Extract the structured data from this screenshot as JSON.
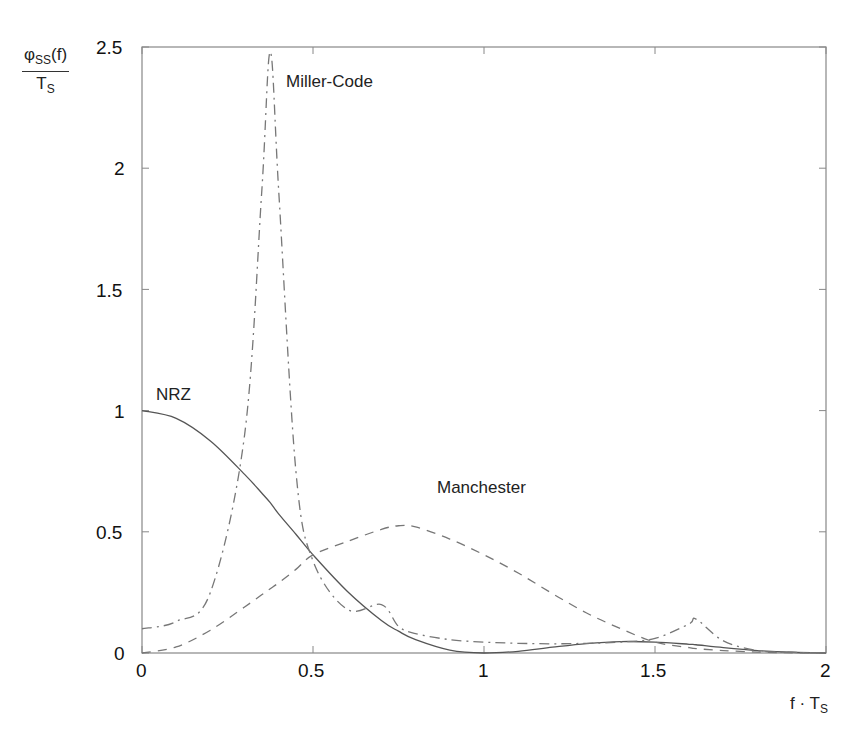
{
  "chart_data": {
    "type": "line",
    "title": "",
    "xlabel": "f·T_S",
    "ylabel": "φ_SS(f) / T_S",
    "xlim": [
      0,
      2
    ],
    "ylim": [
      0,
      2.5
    ],
    "xticks": [
      0,
      0.5,
      1,
      1.5,
      2
    ],
    "yticks": [
      0,
      0.5,
      1,
      1.5,
      2,
      2.5
    ],
    "xtick_labels": [
      "0",
      "0.5",
      "1",
      "1.5",
      "2"
    ],
    "ytick_labels": [
      "0",
      "0.5",
      "1",
      "1.5",
      "2",
      "2.5"
    ],
    "grid": false,
    "legend": "none (inline annotations)",
    "x": [
      0,
      0.1,
      0.2,
      0.3,
      0.35,
      0.375,
      0.4,
      0.45,
      0.5,
      0.6,
      0.7,
      0.75,
      0.8,
      0.9,
      1.0,
      1.1,
      1.2,
      1.3,
      1.4,
      1.5,
      1.6,
      1.62,
      1.7,
      1.8,
      1.9,
      2.0
    ],
    "series": [
      {
        "name": "NRZ",
        "style": "solid",
        "values": [
          1.0,
          0.968,
          0.875,
          0.737,
          0.66,
          0.62,
          0.573,
          0.49,
          0.405,
          0.255,
          0.134,
          0.09,
          0.055,
          0.012,
          0.0,
          0.007,
          0.024,
          0.039,
          0.047,
          0.045,
          0.036,
          0.034,
          0.022,
          0.01,
          0.003,
          0.0
        ]
      },
      {
        "name": "Manchester",
        "style": "dashed",
        "values": [
          0.0,
          0.025,
          0.094,
          0.19,
          0.24,
          0.265,
          0.29,
          0.345,
          0.405,
          0.46,
          0.51,
          0.525,
          0.52,
          0.47,
          0.405,
          0.33,
          0.245,
          0.165,
          0.1,
          0.045,
          0.022,
          0.018,
          0.01,
          0.004,
          0.001,
          0.0
        ]
      },
      {
        "name": "Miller-Code",
        "style": "dash-dot",
        "values": [
          0.1,
          0.13,
          0.25,
          0.9,
          1.9,
          2.48,
          1.9,
          0.75,
          0.38,
          0.18,
          0.2,
          0.11,
          0.08,
          0.055,
          0.045,
          0.04,
          0.038,
          0.04,
          0.045,
          0.06,
          0.12,
          0.14,
          0.05,
          0.01,
          0.003,
          0.0
        ]
      }
    ],
    "annotations": [
      {
        "text": "Miller-Code",
        "x": 0.42,
        "y": 2.38
      },
      {
        "text": "NRZ",
        "x": 0.05,
        "y": 1.04
      },
      {
        "text": "Manchester",
        "x": 0.87,
        "y": 0.57
      }
    ]
  },
  "labels": {
    "miller": "Miller-Code",
    "nrz": "NRZ",
    "manchester": "Manchester",
    "ylabel_num": "φ",
    "ylabel_num_sub": "SS",
    "ylabel_num_arg": "(f)",
    "ylabel_den": "T",
    "ylabel_den_sub": "S",
    "xlabel_main": "f · T",
    "xlabel_sub": "S"
  },
  "ticks": {
    "x": [
      "0",
      "0.5",
      "1",
      "1.5",
      "2"
    ],
    "y": [
      "0",
      "0.5",
      "1",
      "1.5",
      "2",
      "2.5"
    ]
  }
}
